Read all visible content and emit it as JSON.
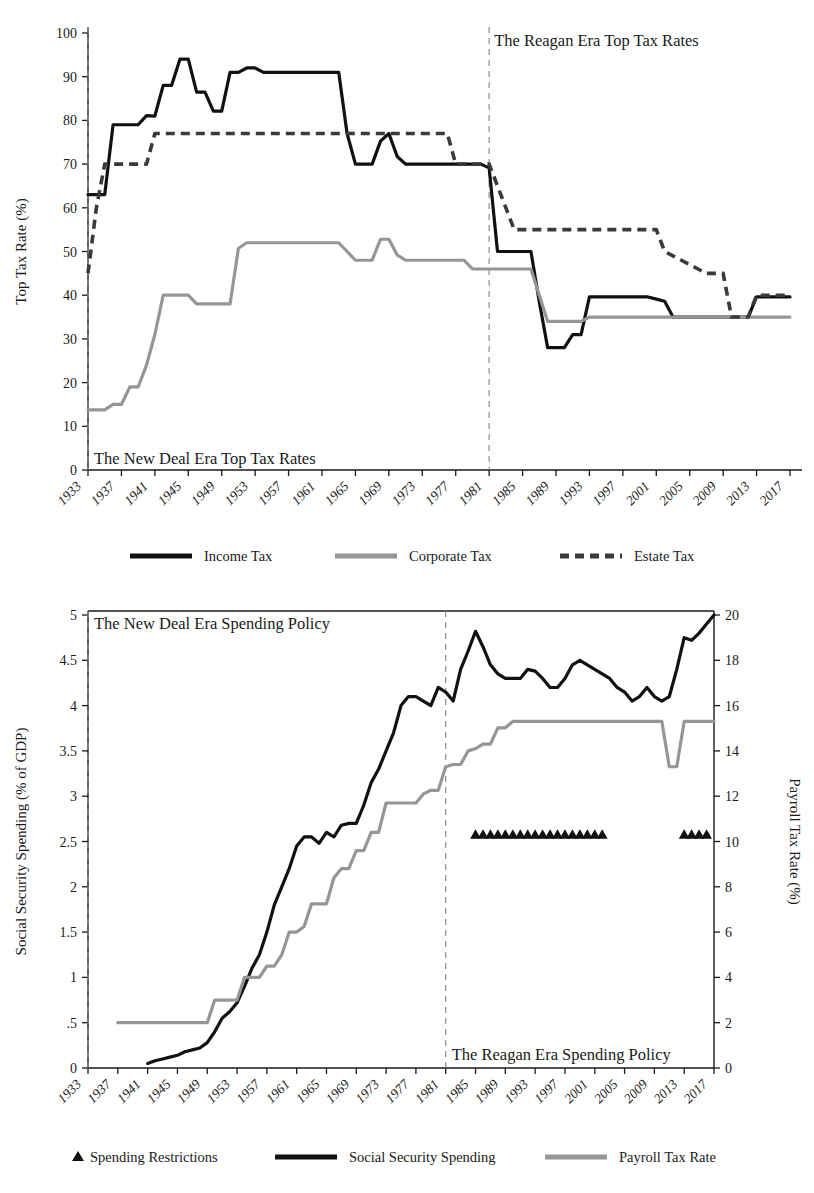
{
  "figure": {
    "background": "#ffffff",
    "ink": "#1a1a1a",
    "series_colors": {
      "black": "#111111",
      "gray": "#969696",
      "dash_gray": "#3a3a3a",
      "era_line": "#8c8c8c"
    }
  },
  "panels": [
    {
      "id": "top",
      "annotations": [
        {
          "name": "new-deal-era-top-tax",
          "text": "The New Deal Era Top Tax Rates"
        },
        {
          "name": "reagan-era-top-tax",
          "text": "The Reagan Era Top Tax Rates"
        }
      ],
      "legend": [
        {
          "label": "Income Tax",
          "style": "solid",
          "color": "#111111"
        },
        {
          "label": "Corporate Tax",
          "style": "solid",
          "color": "#969696"
        },
        {
          "label": "Estate Tax",
          "style": "dashed",
          "color": "#3a3a3a"
        }
      ]
    },
    {
      "id": "bottom",
      "annotations": [
        {
          "name": "new-deal-era-spending",
          "text": "The New Deal Era Spending Policy"
        },
        {
          "name": "reagan-era-spending",
          "text": "The Reagan Era Spending Policy"
        }
      ],
      "legend": [
        {
          "label": "Spending Restrictions",
          "style": "marker",
          "color": "#111111"
        },
        {
          "label": "Social Security Spending",
          "style": "solid",
          "color": "#111111"
        },
        {
          "label": "Payroll Tax Rate",
          "style": "solid",
          "color": "#969696"
        }
      ]
    }
  ],
  "chart_data": [
    {
      "type": "line",
      "title": "",
      "xlabel": "",
      "ylabel": "Top Tax Rate (%)",
      "xlim": [
        1933,
        2017
      ],
      "ylim": [
        0,
        100
      ],
      "yticks": [
        0,
        10,
        20,
        30,
        40,
        50,
        60,
        70,
        80,
        90,
        100
      ],
      "ytick_labels": [
        "0",
        "10",
        "20",
        "30",
        "40",
        "50",
        "60",
        "70",
        "80",
        "90",
        "100"
      ],
      "xticks": [
        1933,
        1937,
        1941,
        1945,
        1949,
        1953,
        1957,
        1961,
        1965,
        1969,
        1973,
        1977,
        1981,
        1985,
        1989,
        1993,
        1997,
        2001,
        2005,
        2009,
        2013,
        2017
      ],
      "xtick_labels": [
        "1933",
        "1937",
        "1941",
        "1945",
        "1949",
        "1953",
        "1957",
        "1961",
        "1965",
        "1969",
        "1973",
        "1977",
        "1981",
        "1985",
        "1989",
        "1993",
        "1997",
        "2001",
        "2005",
        "2009",
        "2013",
        "2017"
      ],
      "grid": false,
      "legend_position": "below",
      "vlines": [
        {
          "x": 1933,
          "style": "dashed",
          "label": "The New Deal Era Top Tax Rates"
        },
        {
          "x": 1981,
          "style": "dashed",
          "label": "The Reagan Era Top Tax Rates"
        }
      ],
      "x": [
        1933,
        1934,
        1935,
        1936,
        1937,
        1938,
        1939,
        1940,
        1941,
        1942,
        1943,
        1944,
        1945,
        1946,
        1947,
        1948,
        1949,
        1950,
        1951,
        1952,
        1953,
        1954,
        1955,
        1956,
        1957,
        1958,
        1959,
        1960,
        1961,
        1962,
        1963,
        1964,
        1965,
        1966,
        1967,
        1968,
        1969,
        1970,
        1971,
        1972,
        1973,
        1974,
        1975,
        1976,
        1977,
        1978,
        1979,
        1980,
        1981,
        1982,
        1983,
        1984,
        1985,
        1986,
        1987,
        1988,
        1989,
        1990,
        1991,
        1992,
        1993,
        1994,
        1995,
        1996,
        1997,
        1998,
        1999,
        2000,
        2001,
        2002,
        2003,
        2004,
        2005,
        2006,
        2007,
        2008,
        2009,
        2010,
        2011,
        2012,
        2013,
        2014,
        2015,
        2016,
        2017
      ],
      "series": [
        {
          "name": "Income Tax",
          "color": "#111111",
          "style": "solid",
          "values": [
            63,
            63,
            63,
            79,
            79,
            79,
            79,
            81.1,
            81,
            88,
            88,
            94,
            94,
            86.45,
            86.45,
            82.13,
            82.13,
            91,
            91,
            92,
            92,
            91,
            91,
            91,
            91,
            91,
            91,
            91,
            91,
            91,
            91,
            77,
            70,
            70,
            70,
            75.25,
            77,
            71.75,
            70,
            70,
            70,
            70,
            70,
            70,
            70,
            70,
            70,
            70,
            69.125,
            50,
            50,
            50,
            50,
            50,
            38.5,
            28,
            28,
            28,
            31,
            31,
            39.6,
            39.6,
            39.6,
            39.6,
            39.6,
            39.6,
            39.6,
            39.6,
            39.1,
            38.6,
            35,
            35,
            35,
            35,
            35,
            35,
            35,
            35,
            35,
            35,
            39.6,
            39.6,
            39.6,
            39.6,
            39.6
          ]
        },
        {
          "name": "Corporate Tax",
          "color": "#969696",
          "style": "solid",
          "values": [
            13.75,
            13.75,
            13.75,
            15,
            15,
            19,
            19,
            24,
            31,
            40,
            40,
            40,
            40,
            38,
            38,
            38,
            38,
            38,
            50.75,
            52,
            52,
            52,
            52,
            52,
            52,
            52,
            52,
            52,
            52,
            52,
            52,
            50,
            48,
            48,
            48,
            52.8,
            52.8,
            49.2,
            48,
            48,
            48,
            48,
            48,
            48,
            48,
            48,
            46,
            46,
            46,
            46,
            46,
            46,
            46,
            46,
            40,
            34,
            34,
            34,
            34,
            34,
            35,
            35,
            35,
            35,
            35,
            35,
            35,
            35,
            35,
            35,
            35,
            35,
            35,
            35,
            35,
            35,
            35,
            35,
            35,
            35,
            35,
            35,
            35,
            35,
            35
          ]
        },
        {
          "name": "Estate Tax",
          "color": "#3a3a3a",
          "style": "dashed",
          "values": [
            45,
            60,
            70,
            70,
            70,
            70,
            70,
            70,
            77,
            77,
            77,
            77,
            77,
            77,
            77,
            77,
            77,
            77,
            77,
            77,
            77,
            77,
            77,
            77,
            77,
            77,
            77,
            77,
            77,
            77,
            77,
            77,
            77,
            77,
            77,
            77,
            77,
            77,
            77,
            77,
            77,
            77,
            77,
            77,
            70,
            70,
            70,
            70,
            70,
            65,
            60,
            55,
            55,
            55,
            55,
            55,
            55,
            55,
            55,
            55,
            55,
            55,
            55,
            55,
            55,
            55,
            55,
            55,
            55,
            50,
            49,
            48,
            47,
            46,
            45,
            45,
            45,
            35,
            35,
            35,
            40,
            40,
            40,
            40,
            40
          ]
        }
      ]
    },
    {
      "type": "line",
      "title": "",
      "xlabel": "",
      "ylabel": "Social Security Spending (% of GDP)",
      "ylabel_right": "Payroll Tax Rate (%)",
      "xlim": [
        1933,
        2017
      ],
      "ylim": [
        0,
        5
      ],
      "ylim_right": [
        0,
        20
      ],
      "yticks": [
        0,
        0.5,
        1,
        1.5,
        2,
        2.5,
        3,
        3.5,
        4,
        4.5,
        5
      ],
      "ytick_labels": [
        "0",
        ".5",
        "1",
        "1.5",
        "2",
        "2.5",
        "3",
        "3.5",
        "4",
        "4.5",
        "5"
      ],
      "yticks_right": [
        0,
        2,
        4,
        6,
        8,
        10,
        12,
        14,
        16,
        18,
        20
      ],
      "ytick_labels_right": [
        "0",
        "2",
        "4",
        "6",
        "8",
        "10",
        "12",
        "14",
        "16",
        "18",
        "20"
      ],
      "xticks": [
        1933,
        1937,
        1941,
        1945,
        1949,
        1953,
        1957,
        1961,
        1965,
        1969,
        1973,
        1977,
        1981,
        1985,
        1989,
        1993,
        1997,
        2001,
        2005,
        2009,
        2013,
        2017
      ],
      "xtick_labels": [
        "1933",
        "1937",
        "1941",
        "1945",
        "1949",
        "1953",
        "1957",
        "1961",
        "1965",
        "1969",
        "1973",
        "1977",
        "1981",
        "1985",
        "1989",
        "1993",
        "1997",
        "2001",
        "2005",
        "2009",
        "2013",
        "2017"
      ],
      "grid": false,
      "legend_position": "below",
      "vlines": [
        {
          "x": 1933,
          "style": "dashed",
          "label": "The New Deal Era Spending Policy"
        },
        {
          "x": 1981,
          "style": "dashed",
          "label": "The Reagan Era Spending Policy"
        }
      ],
      "series": [
        {
          "name": "Social Security Spending",
          "color": "#111111",
          "style": "solid",
          "axis": "left",
          "x": [
            1941,
            1942,
            1943,
            1944,
            1945,
            1946,
            1947,
            1948,
            1949,
            1950,
            1951,
            1952,
            1953,
            1954,
            1955,
            1956,
            1957,
            1958,
            1959,
            1960,
            1961,
            1962,
            1963,
            1964,
            1965,
            1966,
            1967,
            1968,
            1969,
            1970,
            1971,
            1972,
            1973,
            1974,
            1975,
            1976,
            1977,
            1978,
            1979,
            1980,
            1981,
            1982,
            1983,
            1984,
            1985,
            1986,
            1987,
            1988,
            1989,
            1990,
            1991,
            1992,
            1993,
            1994,
            1995,
            1996,
            1997,
            1998,
            1999,
            2000,
            2001,
            2002,
            2003,
            2004,
            2005,
            2006,
            2007,
            2008,
            2009,
            2010,
            2011,
            2012,
            2013,
            2014,
            2015,
            2016,
            2017
          ],
          "values": [
            0.05,
            0.08,
            0.1,
            0.12,
            0.14,
            0.18,
            0.2,
            0.22,
            0.28,
            0.4,
            0.55,
            0.62,
            0.72,
            0.9,
            1.1,
            1.25,
            1.5,
            1.8,
            2.0,
            2.2,
            2.45,
            2.55,
            2.55,
            2.48,
            2.6,
            2.55,
            2.68,
            2.7,
            2.7,
            2.9,
            3.15,
            3.3,
            3.5,
            3.7,
            4.0,
            4.1,
            4.1,
            4.05,
            4.0,
            4.2,
            4.15,
            4.05,
            4.4,
            4.6,
            4.82,
            4.65,
            4.45,
            4.35,
            4.3,
            4.3,
            4.3,
            4.4,
            4.38,
            4.3,
            4.2,
            4.2,
            4.3,
            4.45,
            4.5,
            4.45,
            4.4,
            4.35,
            4.3,
            4.2,
            4.15,
            4.05,
            4.1,
            4.2,
            4.1,
            4.05,
            4.1,
            4.4,
            4.75,
            4.72,
            4.8,
            4.9,
            5.0
          ]
        },
        {
          "name": "Payroll Tax Rate",
          "color": "#969696",
          "style": "solid",
          "axis": "right",
          "x": [
            1937,
            1938,
            1939,
            1940,
            1941,
            1942,
            1943,
            1944,
            1945,
            1946,
            1947,
            1948,
            1949,
            1950,
            1951,
            1952,
            1953,
            1954,
            1955,
            1956,
            1957,
            1958,
            1959,
            1960,
            1961,
            1962,
            1963,
            1964,
            1965,
            1966,
            1967,
            1968,
            1969,
            1970,
            1971,
            1972,
            1973,
            1974,
            1975,
            1976,
            1977,
            1978,
            1979,
            1980,
            1981,
            1982,
            1983,
            1984,
            1985,
            1986,
            1987,
            1988,
            1989,
            1990,
            1991,
            1992,
            1993,
            1994,
            1995,
            1996,
            1997,
            1998,
            1999,
            2000,
            2001,
            2002,
            2003,
            2004,
            2005,
            2006,
            2007,
            2008,
            2009,
            2010,
            2011,
            2012,
            2013,
            2014,
            2015,
            2016,
            2017
          ],
          "values": [
            2,
            2,
            2,
            2,
            2,
            2,
            2,
            2,
            2,
            2,
            2,
            2,
            2,
            3,
            3,
            3,
            3,
            4,
            4,
            4,
            4.5,
            4.5,
            5,
            6,
            6,
            6.25,
            7.25,
            7.25,
            7.25,
            8.4,
            8.8,
            8.8,
            9.6,
            9.6,
            10.4,
            10.4,
            11.7,
            11.7,
            11.7,
            11.7,
            11.7,
            12.1,
            12.26,
            12.26,
            13.3,
            13.4,
            13.4,
            14,
            14.1,
            14.3,
            14.3,
            15.02,
            15.02,
            15.3,
            15.3,
            15.3,
            15.3,
            15.3,
            15.3,
            15.3,
            15.3,
            15.3,
            15.3,
            15.3,
            15.3,
            15.3,
            15.3,
            15.3,
            15.3,
            15.3,
            15.3,
            15.3,
            15.3,
            15.3,
            13.3,
            13.3,
            15.3,
            15.3,
            15.3,
            15.3,
            15.3
          ]
        },
        {
          "name": "Spending Restrictions",
          "color": "#111111",
          "style": "marker",
          "marker": "triangle",
          "axis": "left",
          "value": 2.53,
          "x": [
            1985,
            1986,
            1987,
            1988,
            1989,
            1990,
            1991,
            1992,
            1993,
            1994,
            1995,
            1996,
            1997,
            1998,
            1999,
            2000,
            2001,
            2002,
            2013,
            2014,
            2015,
            2016
          ]
        }
      ]
    }
  ]
}
